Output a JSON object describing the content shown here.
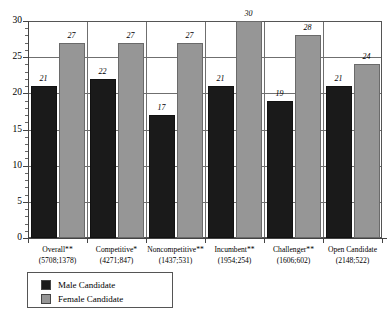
{
  "chart_data": {
    "type": "bar",
    "title": "",
    "subtitle": "",
    "xlabel": "",
    "ylabel": "",
    "ylim": [
      0,
      30
    ],
    "yticks": [
      0,
      5,
      10,
      15,
      20,
      25,
      30
    ],
    "ytick_labels": [
      "0",
      "5",
      "10",
      "15",
      "20",
      "25",
      "30"
    ],
    "minor_tick_step": 1,
    "grid": true,
    "grid_axis": "y",
    "legend_position": "bottom-left",
    "categories": [
      "Overall**",
      "Competitive*",
      "Noncompetitive**",
      "Incumbent**",
      "Challenger**",
      "Open Candidate"
    ],
    "category_sublabels": [
      "(5708;1378)",
      "(4271;847)",
      "(1437;531)",
      "(1954;254)",
      "(1606;602)",
      "(2148;522)"
    ],
    "series": [
      {
        "name": "Male Candidate",
        "color": "#1a1a1a",
        "values": [
          21,
          22,
          17,
          21,
          19,
          21
        ]
      },
      {
        "name": "Female Candidate",
        "color": "#969696",
        "values": [
          27,
          27,
          27,
          30,
          28,
          24
        ]
      }
    ]
  },
  "legend": {
    "items": [
      {
        "label": "Male Candidate",
        "swatch": "male"
      },
      {
        "label": "Female Candidate",
        "swatch": "female"
      }
    ]
  },
  "colors": {
    "male": "#1a1a1a",
    "female": "#969696",
    "axis": "#444444",
    "grid": "#6f6f6f",
    "background": "#ffffff"
  }
}
